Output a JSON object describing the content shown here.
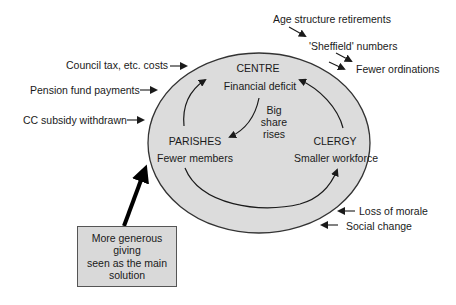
{
  "colors": {
    "ellipse_fill": "#dcdcdc",
    "ellipse_stroke": "#333333",
    "box_fill": "#d9d9d9",
    "ink": "#1a1a1a"
  },
  "nodes": {
    "centre": {
      "title": "CENTRE",
      "subtitle": "Financial deficit"
    },
    "parishes": {
      "title": "PARISHES",
      "subtitle": "Fewer members"
    },
    "clergy": {
      "title": "CLERGY",
      "subtitle": "Smaller workforce"
    }
  },
  "inner_label": {
    "line1": "Big",
    "line2": "share",
    "line3": "rises"
  },
  "external_pressures": {
    "left": [
      "Council tax, etc. costs",
      "Pension fund payments",
      "CC subsidy withdrawn"
    ],
    "top_right": [
      "Age structure retirements",
      "'Sheffield' numbers",
      "Fewer ordinations"
    ],
    "bottom_right": [
      "Loss of morale",
      "Social change"
    ]
  },
  "solution_box": {
    "line1": "More generous",
    "line2": "giving",
    "line3": "seen as the main",
    "line4": "solution"
  }
}
